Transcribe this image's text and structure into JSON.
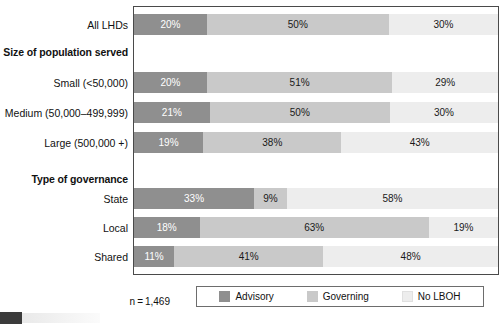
{
  "chart_data": {
    "type": "bar",
    "orientation": "horizontal",
    "stacked": true,
    "normalized_percent": true,
    "title": "",
    "subtitle": "",
    "xlabel": "",
    "ylabel": "",
    "xlim": [
      0,
      100
    ],
    "grid": false,
    "legend_position": "bottom",
    "categories": [
      "All LHDs",
      "Small (<50,000)",
      "Medium (50,000–499,999)",
      "Large (500,000 +)",
      "State",
      "Local",
      "Shared"
    ],
    "group_headings": [
      {
        "label": "Size of population served",
        "before_category": "Small (<50,000)"
      },
      {
        "label": "Type of governance",
        "before_category": "State"
      }
    ],
    "series": [
      {
        "name": "Advisory",
        "color": "#8f8f8f",
        "values": [
          20,
          20,
          21,
          19,
          33,
          18,
          11
        ]
      },
      {
        "name": "Governing",
        "color": "#c9c9c9",
        "values": [
          50,
          51,
          50,
          38,
          9,
          63,
          41
        ]
      },
      {
        "name": "No LBOH",
        "color": "#ededed",
        "values": [
          30,
          29,
          30,
          43,
          58,
          19,
          48
        ]
      }
    ],
    "data_labels": [
      [
        "20%",
        "50%",
        "30%"
      ],
      [
        "20%",
        "51%",
        "29%"
      ],
      [
        "21%",
        "50%",
        "30%"
      ],
      [
        "19%",
        "38%",
        "43%"
      ],
      [
        "33%",
        "9%",
        "58%"
      ],
      [
        "18%",
        "63%",
        "19%"
      ],
      [
        "11%",
        "41%",
        "48%"
      ]
    ],
    "annotations": [
      "n=1,469"
    ]
  },
  "rows": [
    {
      "label": "All LHDs",
      "top": 14,
      "segments": [
        {
          "pct": 20,
          "text": "20%",
          "cls": "seg-advisory"
        },
        {
          "pct": 50,
          "text": "50%",
          "cls": "seg-governing"
        },
        {
          "pct": 30,
          "text": "30%",
          "cls": "seg-nolboh"
        }
      ]
    },
    {
      "label": "Small (<50,000)",
      "top": 72,
      "segments": [
        {
          "pct": 20,
          "text": "20%",
          "cls": "seg-advisory"
        },
        {
          "pct": 51,
          "text": "51%",
          "cls": "seg-governing"
        },
        {
          "pct": 29,
          "text": "29%",
          "cls": "seg-nolboh"
        }
      ]
    },
    {
      "label": "Medium (50,000–499,999)",
      "top": 102,
      "segments": [
        {
          "pct": 21,
          "text": "21%",
          "cls": "seg-advisory"
        },
        {
          "pct": 50,
          "text": "50%",
          "cls": "seg-governing"
        },
        {
          "pct": 30,
          "text": "30%",
          "cls": "seg-nolboh"
        }
      ]
    },
    {
      "label": "Large (500,000 +)",
      "top": 132,
      "segments": [
        {
          "pct": 19,
          "text": "19%",
          "cls": "seg-advisory"
        },
        {
          "pct": 38,
          "text": "38%",
          "cls": "seg-governing"
        },
        {
          "pct": 43,
          "text": "43%",
          "cls": "seg-nolboh"
        }
      ]
    },
    {
      "label": "State",
      "top": 188,
      "segments": [
        {
          "pct": 33,
          "text": "33%",
          "cls": "seg-advisory"
        },
        {
          "pct": 9,
          "text": "9%",
          "cls": "seg-governing"
        },
        {
          "pct": 58,
          "text": "58%",
          "cls": "seg-nolboh"
        }
      ]
    },
    {
      "label": "Local",
      "top": 217,
      "segments": [
        {
          "pct": 18,
          "text": "18%",
          "cls": "seg-advisory"
        },
        {
          "pct": 63,
          "text": "63%",
          "cls": "seg-governing"
        },
        {
          "pct": 19,
          "text": "19%",
          "cls": "seg-nolboh"
        }
      ]
    },
    {
      "label": "Shared",
      "top": 246,
      "segments": [
        {
          "pct": 11,
          "text": "11%",
          "cls": "seg-advisory"
        },
        {
          "pct": 41,
          "text": "41%",
          "cls": "seg-governing"
        },
        {
          "pct": 48,
          "text": "48%",
          "cls": "seg-nolboh"
        }
      ]
    }
  ],
  "headings": [
    {
      "label": "Size of population served",
      "top": 46
    },
    {
      "label": "Type of governance",
      "top": 173
    }
  ],
  "legend": {
    "items": [
      {
        "label": "Advisory",
        "swatch": "swatch-advisory"
      },
      {
        "label": "Governing",
        "swatch": "swatch-governing"
      },
      {
        "label": "No LBOH",
        "swatch": "swatch-nolboh"
      }
    ]
  },
  "footnote": {
    "text": "n = 1,469"
  },
  "colors": {
    "advisory": "#8f8f8f",
    "governing": "#c9c9c9",
    "no_lboh": "#ededed",
    "frame": "#4a4a4a"
  }
}
